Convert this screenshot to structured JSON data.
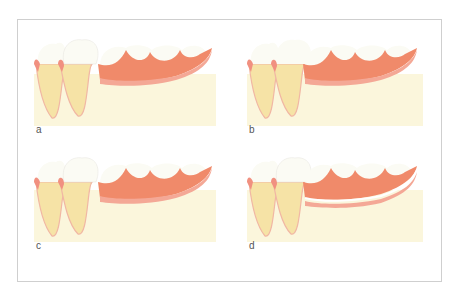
{
  "figure": {
    "type": "dental-illustration",
    "colors": {
      "frame_border": "#cfcfcf",
      "bone": "#fbf6dc",
      "tooth_root": "#f6e3a6",
      "tooth_crown": "#fbfbf4",
      "gingiva": "#f19080",
      "denture_base": "#f08a6a",
      "denture_tissue_surface": "#f4a896",
      "reline_gap": "#ffffff"
    },
    "panels": [
      {
        "id": "a",
        "label": "a",
        "reline_gap": false
      },
      {
        "id": "b",
        "label": "b",
        "reline_gap": false
      },
      {
        "id": "c",
        "label": "c",
        "reline_gap": false
      },
      {
        "id": "d",
        "label": "d",
        "reline_gap": true
      }
    ]
  }
}
